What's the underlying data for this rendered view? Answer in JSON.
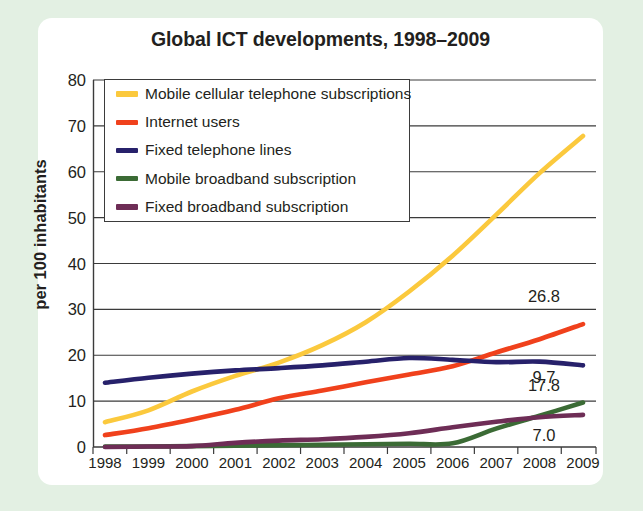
{
  "chart_data": {
    "type": "line",
    "title": "Global ICT developments, 1998–2009",
    "xlabel": "",
    "ylabel": "per 100 inhabitants",
    "grid": true,
    "legend_position": "top-left inside plot",
    "xlim": [
      1998,
      2009
    ],
    "ylim": [
      0,
      80
    ],
    "ytick_labels": [
      "0",
      "10",
      "20",
      "30",
      "40",
      "50",
      "60",
      "70",
      "80"
    ],
    "ytick_values": [
      0,
      10,
      20,
      30,
      40,
      50,
      60,
      70,
      80
    ],
    "categories": [
      "1998",
      "1999",
      "2000",
      "2001",
      "2002",
      "2003",
      "2004",
      "2005",
      "2006",
      "2007",
      "2008",
      "2009"
    ],
    "x": [
      1998,
      1999,
      2000,
      2001,
      2002,
      2003,
      2004,
      2005,
      2006,
      2007,
      2008,
      2009
    ],
    "series": [
      {
        "name": "Mobile cellular telephone subscriptions",
        "color": "#fbc93d",
        "values": [
          5.4,
          8.0,
          12.1,
          15.5,
          18.4,
          22.2,
          27.2,
          33.9,
          41.7,
          50.6,
          59.7,
          67.8
        ],
        "end_label": ""
      },
      {
        "name": "Internet users",
        "color": "#f0411c",
        "values": [
          2.6,
          4.1,
          6.0,
          8.1,
          10.6,
          12.3,
          14.1,
          15.8,
          17.6,
          20.6,
          23.5,
          26.8
        ],
        "end_label": "26.8"
      },
      {
        "name": "Fixed telephone lines",
        "color": "#27216b",
        "values": [
          14.0,
          15.1,
          16.0,
          16.7,
          17.2,
          17.8,
          18.6,
          19.4,
          19.0,
          18.5,
          18.6,
          17.8
        ],
        "end_label": "17.8"
      },
      {
        "name": "Mobile broadband subscription",
        "color": "#3b6b35",
        "values": [
          0.1,
          0.1,
          0.2,
          0.3,
          0.4,
          0.5,
          0.6,
          0.7,
          0.8,
          4.0,
          6.8,
          9.7
        ],
        "end_label": "9.7"
      },
      {
        "name": "Fixed broadband subscription",
        "color": "#6e2d56",
        "values": [
          0.0,
          0.1,
          0.2,
          0.9,
          1.4,
          1.7,
          2.2,
          3.0,
          4.3,
          5.5,
          6.5,
          7.0
        ],
        "end_label": "7.0"
      }
    ],
    "endpoint_labels": [
      {
        "text": "26.8",
        "series": "Internet users"
      },
      {
        "text": "17.8",
        "series": "Fixed telephone lines"
      },
      {
        "text": "9.7",
        "series": "Mobile broadband subscription"
      },
      {
        "text": "7.0",
        "series": "Fixed broadband subscription"
      }
    ]
  },
  "legend": {
    "items": [
      {
        "label": "Mobile cellular telephone subscriptions",
        "color": "#fbc93d"
      },
      {
        "label": "Internet users",
        "color": "#f0411c"
      },
      {
        "label": "Fixed telephone lines",
        "color": "#27216b"
      },
      {
        "label": "Mobile broadband subscription",
        "color": "#3b6b35"
      },
      {
        "label": "Fixed broadband subscription",
        "color": "#6e2d56"
      }
    ]
  },
  "theme": {
    "page_background": "#e3f0e3",
    "card_background": "#ffffff",
    "axis_color": "#3b3b3b",
    "text_color": "#231f20"
  }
}
